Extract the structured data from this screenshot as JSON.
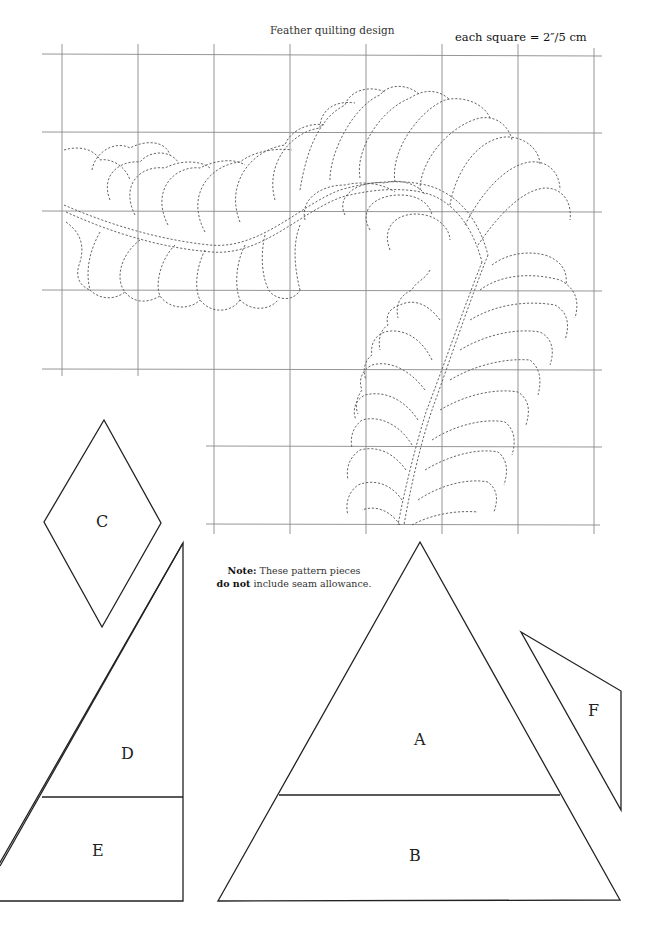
{
  "page": {
    "header_text": "RUNNING HEAD",
    "title": "Feather quilting design",
    "scale_note": "each square = 2″/5 cm"
  },
  "note": {
    "bold_lead": "Note:",
    "text_1": " These pattern pieces",
    "bold_2": "do not",
    "text_2": " include seam allowance."
  },
  "grid": {
    "square_size_label": "2″/5 cm",
    "columns_x": [
      62,
      138,
      214,
      290,
      366,
      442,
      518,
      594
    ],
    "rows_y": [
      54,
      132,
      211,
      290,
      369,
      446,
      524
    ],
    "line_color": "#8a8a8a",
    "stitch_color": "#555555"
  },
  "pieces": [
    {
      "id": "A",
      "label": "A",
      "shape": "triangle-top"
    },
    {
      "id": "B",
      "label": "B",
      "shape": "trapezoid"
    },
    {
      "id": "C",
      "label": "C",
      "shape": "diamond"
    },
    {
      "id": "D",
      "label": "D",
      "shape": "right-triangle-top"
    },
    {
      "id": "E",
      "label": "E",
      "shape": "right-trapezoid"
    },
    {
      "id": "F",
      "label": "F",
      "shape": "quadrilateral"
    }
  ]
}
